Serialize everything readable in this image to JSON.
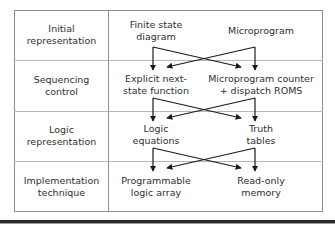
{
  "diagram": {
    "rows": [
      {
        "label": "Initial\nrepresentation",
        "label_line1": "Initial",
        "label_line2": "representation",
        "options": [
          {
            "name": "finite-state-diagram",
            "line1": "Finite state",
            "line2": "diagram"
          },
          {
            "name": "microprogram",
            "line1": "Microprogram",
            "line2": ""
          }
        ]
      },
      {
        "label": "Sequencing\ncontrol",
        "label_line1": "Sequencing",
        "label_line2": "control",
        "options": [
          {
            "name": "explicit-next-state-function",
            "line1": "Explicit next-",
            "line2": "state function"
          },
          {
            "name": "microprogram-counter-dispatch-roms",
            "line1": "Microprogram counter",
            "line2": "+ dispatch ROMS"
          }
        ]
      },
      {
        "label": "Logic\nrepresentation",
        "label_line1": "Logic",
        "label_line2": "representation",
        "options": [
          {
            "name": "logic-equations",
            "line1": "Logic",
            "line2": "equations"
          },
          {
            "name": "truth-tables",
            "line1": "Truth",
            "line2": "tables"
          }
        ]
      },
      {
        "label": "Implementation\ntechnique",
        "label_line1": "Implementation",
        "label_line2": "technique",
        "options": [
          {
            "name": "programmable-logic-array",
            "line1": "Programmable",
            "line2": "logic array"
          },
          {
            "name": "read-only-memory",
            "line1": "Read-only",
            "line2": "memory"
          }
        ]
      }
    ],
    "arrow_groups": [
      {
        "from_row": 0,
        "to_row": 1,
        "connections": [
          "left-to-left",
          "left-to-right",
          "right-to-left",
          "right-to-right"
        ]
      },
      {
        "from_row": 1,
        "to_row": 2,
        "connections": [
          "left-to-left",
          "left-to-right",
          "right-to-left",
          "right-to-right"
        ]
      },
      {
        "from_row": 2,
        "to_row": 3,
        "connections": [
          "left-to-left",
          "left-to-right",
          "right-to-left",
          "right-to-right"
        ]
      }
    ],
    "colors": {
      "frame_border": "#8e8e8e",
      "row_divider": "#b7b7b7",
      "text": "#2f2f2f",
      "arrow": "#1a1a1a",
      "bottom_rule": "#2a2a2a",
      "background": "#ffffff"
    }
  }
}
